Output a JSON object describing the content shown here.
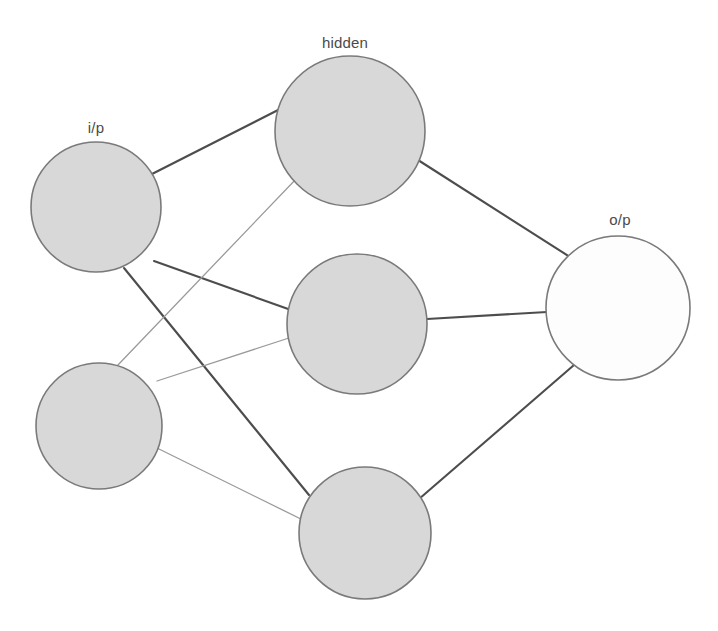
{
  "diagram": {
    "background_color": "#ffffff",
    "canvas": {
      "width": 718,
      "height": 631
    }
  },
  "labels": {
    "input": "i/p",
    "hidden": "hidden",
    "output": "o/p"
  },
  "label_positions": {
    "input": {
      "x": 96,
      "y": 133
    },
    "hidden": {
      "x": 345,
      "y": 48
    },
    "output": {
      "x": 620,
      "y": 225
    }
  },
  "colors": {
    "node_fill": "#d8d8d8",
    "node_open_fill": "#fdfdfd",
    "node_stroke": "#7a7a7a",
    "edge_dark": "#4d4d4d",
    "edge_light": "#9a9a9a",
    "label_text": "#4a4a4a"
  },
  "layers": [
    {
      "id": "input",
      "name": "input-layer",
      "label": "i/p",
      "node_count": 2,
      "nodes": [
        {
          "id": "i1",
          "cx": 96,
          "cy": 207,
          "r": 65,
          "fill": "filled"
        },
        {
          "id": "i2",
          "cx": 99,
          "cy": 426,
          "r": 63,
          "fill": "filled"
        }
      ]
    },
    {
      "id": "hidden",
      "name": "hidden-layer",
      "label": "hidden",
      "node_count": 3,
      "nodes": [
        {
          "id": "h1",
          "cx": 350,
          "cy": 131,
          "r": 75,
          "fill": "filled"
        },
        {
          "id": "h2",
          "cx": 357,
          "cy": 324,
          "r": 70,
          "fill": "filled"
        },
        {
          "id": "h3",
          "cx": 365,
          "cy": 533,
          "r": 66,
          "fill": "filled"
        }
      ]
    },
    {
      "id": "output",
      "name": "output-layer",
      "label": "o/p",
      "node_count": 1,
      "nodes": [
        {
          "id": "o1",
          "cx": 618,
          "cy": 308,
          "r": 72,
          "fill": "open"
        }
      ]
    }
  ],
  "edges": [
    {
      "id": "e-i1-h1",
      "from": "i1",
      "to": "h1",
      "weight_style": "dark",
      "x1": 152,
      "y1": 174,
      "x2": 282,
      "y2": 108
    },
    {
      "id": "e-i1-h2",
      "from": "i1",
      "to": "h2",
      "weight_style": "dark",
      "x1": 154,
      "y1": 261,
      "x2": 291,
      "y2": 310
    },
    {
      "id": "e-i1-h3",
      "from": "i1",
      "to": "h3",
      "weight_style": "dark",
      "x1": 124,
      "y1": 268,
      "x2": 309,
      "y2": 495
    },
    {
      "id": "e-i2-h1",
      "from": "i2",
      "to": "h1",
      "weight_style": "light",
      "x1": 117,
      "y1": 366,
      "x2": 297,
      "y2": 178
    },
    {
      "id": "e-i2-h2",
      "from": "i2",
      "to": "h2",
      "weight_style": "light",
      "x1": 157,
      "y1": 381,
      "x2": 292,
      "y2": 337
    },
    {
      "id": "e-i2-h3",
      "from": "i2",
      "to": "h3",
      "weight_style": "light",
      "x1": 157,
      "y1": 448,
      "x2": 311,
      "y2": 524
    },
    {
      "id": "e-h1-o1",
      "from": "h1",
      "to": "o1",
      "weight_style": "dark",
      "x1": 418,
      "y1": 160,
      "x2": 570,
      "y2": 257
    },
    {
      "id": "e-h2-o1",
      "from": "h2",
      "to": "o1",
      "weight_style": "dark",
      "x1": 427,
      "y1": 319,
      "x2": 547,
      "y2": 312
    },
    {
      "id": "e-h3-o1",
      "from": "h3",
      "to": "o1",
      "weight_style": "dark",
      "x1": 419,
      "y1": 499,
      "x2": 574,
      "y2": 365
    }
  ],
  "chart_data": {
    "type": "diagram",
    "diagram_kind": "feedforward-neural-network",
    "title": "",
    "architecture": "2-3-1",
    "layer_labels": [
      "i/p",
      "hidden",
      "o/p"
    ],
    "layer_sizes": [
      2,
      3,
      1
    ],
    "node_ids": [
      [
        "i1",
        "i2"
      ],
      [
        "h1",
        "h2",
        "h3"
      ],
      [
        "o1"
      ]
    ],
    "connections": [
      [
        "i1",
        "h1"
      ],
      [
        "i1",
        "h2"
      ],
      [
        "i1",
        "h3"
      ],
      [
        "i2",
        "h1"
      ],
      [
        "i2",
        "h2"
      ],
      [
        "i2",
        "h3"
      ],
      [
        "h1",
        "o1"
      ],
      [
        "h2",
        "o1"
      ],
      [
        "h3",
        "o1"
      ]
    ],
    "edge_count": 9,
    "fully_connected": true,
    "node_count": 6
  }
}
